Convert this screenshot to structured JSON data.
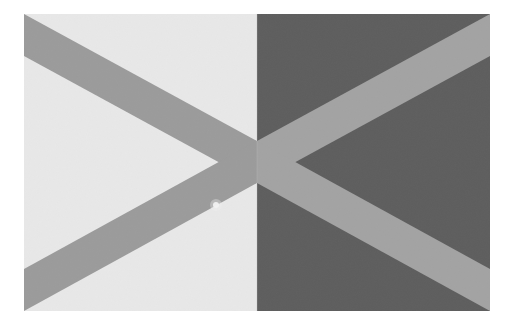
{
  "scene": {
    "title": "Two-tone geometric wall with converging diagonal bands",
    "description": "A rectangular photographic surface split vertically into a light gray left half and a dark gray right half, overlaid by four medium-gray diagonal bands that converge to a single point at the exact center, forming an X / double-arrow motif.",
    "type": "Natural-Image",
    "canvas": {
      "width_px": 514,
      "height_px": 329,
      "background_color": "#ffffff"
    },
    "artwork_frame": {
      "left_px": 24,
      "top_px": 14,
      "width_px": 466,
      "height_px": 297,
      "label": "photograph-area"
    }
  },
  "palette": {
    "page_background": "#ffffff",
    "left_panel": "#e8e8e8",
    "right_panel": "#5e5e5e",
    "band_on_light": "#9b9b9b",
    "band_on_dark": "#a3a3a3",
    "highlight_dot": "#f4f4f4",
    "seam_line": "#bdbdbd"
  },
  "geometry": {
    "split_x_px": 233,
    "center_point": {
      "x_px": 233,
      "y_px": 148
    },
    "band_half_thickness_px": 21,
    "bands": [
      {
        "name": "band-top-left",
        "from_corner": "top-left",
        "to_point": "center",
        "panel": "light",
        "color": "#9b9b9b"
      },
      {
        "name": "band-bottom-left",
        "from_corner": "bottom-left",
        "to_point": "center",
        "panel": "light",
        "color": "#9b9b9b"
      },
      {
        "name": "band-top-right",
        "from_corner": "top-right",
        "to_point": "center",
        "panel": "dark",
        "color": "#a3a3a3"
      },
      {
        "name": "band-bottom-right",
        "from_corner": "bottom-right",
        "to_point": "center",
        "panel": "dark",
        "color": "#a3a3a3"
      }
    ],
    "highlight_dot": {
      "name": "light-speck",
      "x_px": 192,
      "y_px": 191,
      "radius_px": 3
    }
  },
  "accessibility": {
    "alt_text": "Abstract photograph of a wall divided into light and dark halves with four gray diagonal stripes meeting at the center."
  }
}
